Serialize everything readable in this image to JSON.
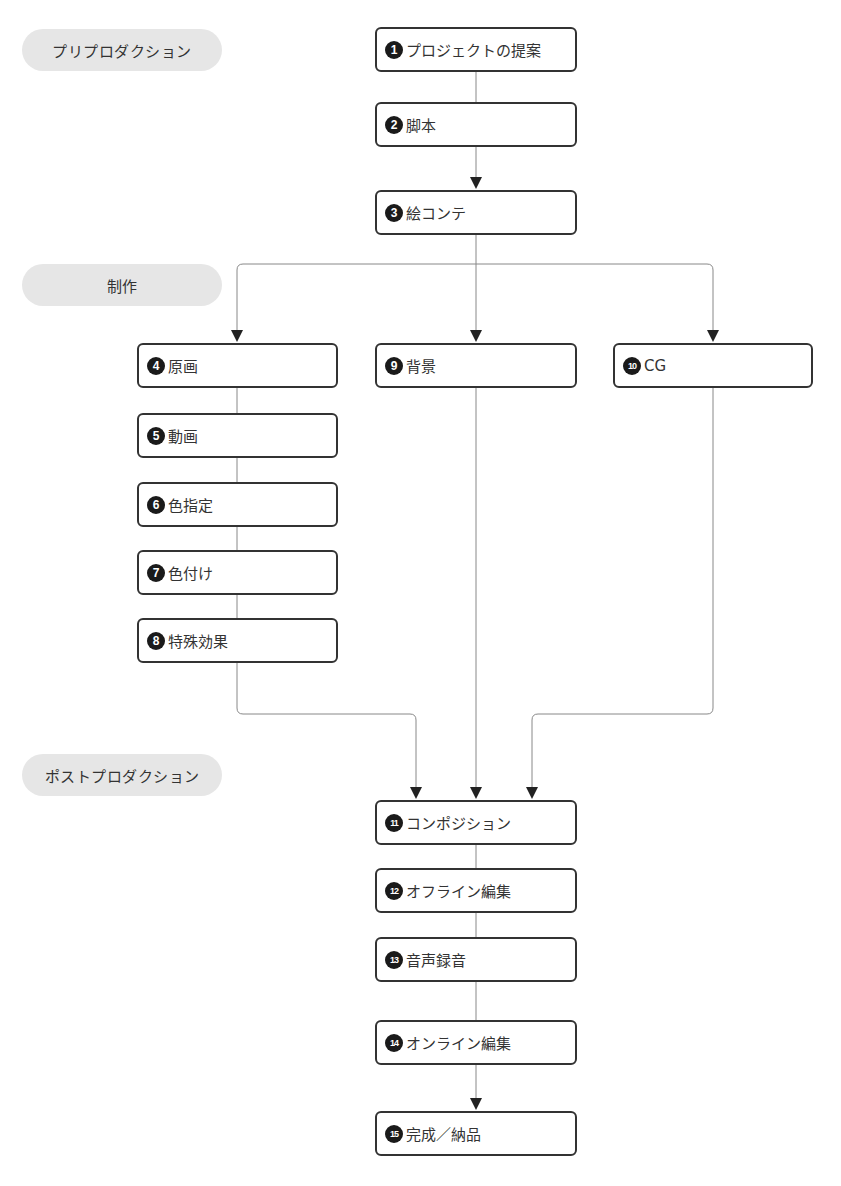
{
  "phases": [
    {
      "id": "pre",
      "label": "プリプロダクション"
    },
    {
      "id": "prod",
      "label": "制作"
    },
    {
      "id": "post",
      "label": "ポストプロダクション"
    }
  ],
  "steps": [
    {
      "num": "1",
      "label": "プロジェクトの提案"
    },
    {
      "num": "2",
      "label": "脚本"
    },
    {
      "num": "3",
      "label": "絵コンテ"
    },
    {
      "num": "4",
      "label": "原画"
    },
    {
      "num": "5",
      "label": "動画"
    },
    {
      "num": "6",
      "label": "色指定"
    },
    {
      "num": "7",
      "label": "色付け"
    },
    {
      "num": "8",
      "label": "特殊効果"
    },
    {
      "num": "9",
      "label": "背景"
    },
    {
      "num": "10",
      "label": "CG"
    },
    {
      "num": "11",
      "label": "コンポジション"
    },
    {
      "num": "12",
      "label": "オフライン編集"
    },
    {
      "num": "13",
      "label": "音声録音"
    },
    {
      "num": "14",
      "label": "オンライン編集"
    },
    {
      "num": "15",
      "label": "完成／納品"
    }
  ],
  "colors": {
    "phase_bg": "#e6e6e6",
    "box_border": "#333333",
    "number_badge": "#1a1a1a",
    "connector": "#777777",
    "arrow": "#222222"
  }
}
